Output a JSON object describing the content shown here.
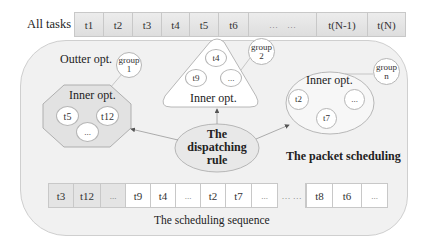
{
  "all_tasks": {
    "label": "All tasks",
    "cells": [
      "t1",
      "t2",
      "t3",
      "t4",
      "t5",
      "t6",
      "…    …",
      "t(N-1)",
      "t(N)"
    ]
  },
  "outer": {
    "label": "Outter opt."
  },
  "groups": [
    {
      "label": "group\n1",
      "line1": "group",
      "line2": "1",
      "inner_label": "Inner opt.",
      "shape": "octagon",
      "tasks": [
        "t5",
        "t12",
        "..."
      ]
    },
    {
      "label": "group\n2",
      "line1": "group",
      "line2": "2",
      "inner_label": "Inner opt.",
      "shape": "triangle",
      "tasks": [
        "t4",
        "t9",
        "..."
      ]
    },
    {
      "label": "group\nn",
      "line1": "group",
      "line2": "n",
      "inner_label": "Inner opt.",
      "shape": "ellipse",
      "tasks": [
        "t2",
        "t7",
        "..."
      ]
    }
  ],
  "dispatching_rule": {
    "line1": "The",
    "line2": "dispatching",
    "line3": "rule"
  },
  "packet_scheduling_label": "The packet scheduling",
  "scheduling_sequence": {
    "label": "The scheduling sequence",
    "cells": [
      {
        "text": "t3",
        "shaded": true
      },
      {
        "text": "t12",
        "shaded": true
      },
      {
        "text": "...",
        "shaded": true
      },
      {
        "text": "t9",
        "shaded": false
      },
      {
        "text": "t4",
        "shaded": false
      },
      {
        "text": "...",
        "shaded": false
      },
      {
        "text": "t2",
        "shaded": false
      },
      {
        "text": "t7",
        "shaded": false
      },
      {
        "text": "...",
        "shaded": false
      },
      {
        "text": "… …",
        "shaded": false,
        "gap": true
      },
      {
        "text": "t8",
        "shaded": false
      },
      {
        "text": "t6",
        "shaded": false
      },
      {
        "text": "...",
        "shaded": false
      }
    ]
  },
  "colors": {
    "container_fill": "#f1f1f1",
    "shape_fill": "#ffffff",
    "octagon_fill": "#e2e2e2",
    "border": "#b5b5b5",
    "shaded_cell": "#e4e4e4"
  }
}
